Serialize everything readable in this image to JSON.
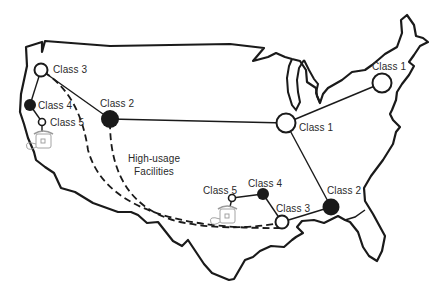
{
  "diagram": {
    "colors": {
      "ink": "#1a1a1a",
      "paper": "#ffffff",
      "phone": "#9a9a9a"
    },
    "nodes": [
      {
        "id": "west-c3",
        "label": "Class 3",
        "cls": 3,
        "x": 41,
        "y": 70,
        "filled": false
      },
      {
        "id": "west-c4",
        "label": "Class 4",
        "cls": 4,
        "x": 30,
        "y": 105,
        "filled": true
      },
      {
        "id": "west-c5",
        "label": "Class 5",
        "cls": 5,
        "x": 42,
        "y": 122,
        "filled": false
      },
      {
        "id": "west-c2",
        "label": "Class 2",
        "cls": 2,
        "x": 110,
        "y": 119,
        "filled": true
      },
      {
        "id": "central-c1",
        "label": "Class 1",
        "cls": 1,
        "x": 286,
        "y": 123,
        "filled": false
      },
      {
        "id": "ne-c1",
        "label": "Class 1",
        "cls": 1,
        "x": 382,
        "y": 83,
        "filled": false
      },
      {
        "id": "se-c2",
        "label": "Class 2",
        "cls": 2,
        "x": 331,
        "y": 207,
        "filled": true
      },
      {
        "id": "south-c3",
        "label": "Class 3",
        "cls": 3,
        "x": 282,
        "y": 222,
        "filled": false
      },
      {
        "id": "south-c4",
        "label": "Class 4",
        "cls": 4,
        "x": 263,
        "y": 194,
        "filled": true
      },
      {
        "id": "south-c5",
        "label": "Class 5",
        "cls": 5,
        "x": 232,
        "y": 198,
        "filled": false
      }
    ],
    "labels": [
      {
        "id": "lbl-west-c3",
        "text": "Class 3",
        "x": 53,
        "y": 64
      },
      {
        "id": "lbl-west-c4",
        "text": "Class 4",
        "x": 38,
        "y": 100
      },
      {
        "id": "lbl-west-c5",
        "text": "Class 5",
        "x": 50,
        "y": 117
      },
      {
        "id": "lbl-west-c2",
        "text": "Class 2",
        "x": 100,
        "y": 98
      },
      {
        "id": "lbl-central-c1",
        "text": "Class 1",
        "x": 299,
        "y": 122
      },
      {
        "id": "lbl-ne-c1",
        "text": "Class 1",
        "x": 372,
        "y": 61
      },
      {
        "id": "lbl-se-c2",
        "text": "Class 2",
        "x": 327,
        "y": 185
      },
      {
        "id": "lbl-south-c3",
        "text": "Class 3",
        "x": 276,
        "y": 203
      },
      {
        "id": "lbl-south-c4",
        "text": "Class 4",
        "x": 248,
        "y": 178
      },
      {
        "id": "lbl-south-c5",
        "text": "Class 5",
        "x": 203,
        "y": 185
      }
    ],
    "annotation": {
      "line1": "High-usage",
      "line2": "Facilities",
      "x": 124,
      "y": 153
    },
    "links_solid": [
      [
        "west-c3",
        "west-c4"
      ],
      [
        "west-c4",
        "west-c5"
      ],
      [
        "west-c3",
        "west-c2"
      ],
      [
        "west-c2",
        "central-c1"
      ],
      [
        "central-c1",
        "ne-c1"
      ],
      [
        "central-c1",
        "se-c2"
      ],
      [
        "se-c2",
        "south-c3"
      ],
      [
        "south-c3",
        "south-c4"
      ],
      [
        "south-c4",
        "south-c5"
      ]
    ],
    "links_dashed": [
      {
        "from": "west-c3",
        "to": "south-c3",
        "name": "high-usage-trunk-1"
      },
      {
        "from": "west-c2",
        "to": "south-c3",
        "name": "high-usage-trunk-2"
      }
    ]
  }
}
